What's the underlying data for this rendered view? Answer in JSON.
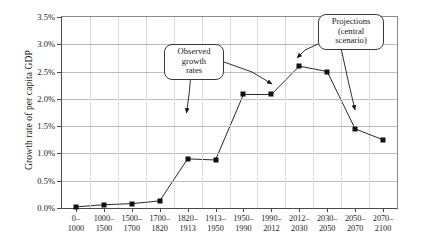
{
  "chart_data": {
    "type": "line",
    "title": "",
    "xlabel": "",
    "ylabel": "Growth rate of per capita GDP",
    "ylim": [
      0.0,
      3.5
    ],
    "ytick_values": [
      0.0,
      0.5,
      1.0,
      1.5,
      2.0,
      2.5,
      3.0,
      3.5
    ],
    "ytick_labels": [
      "0.0%",
      "0.5%",
      "1.0%",
      "1.5%",
      "2.0%",
      "2.5%",
      "3.0%",
      "3.5%"
    ],
    "grid": {
      "horizontal": true,
      "vertical": true,
      "vertical_style": "dotted"
    },
    "legend": null,
    "categories": [
      "0-1000",
      "1000-1500",
      "1500-1700",
      "1700-1820",
      "1820-1913",
      "1913-1950",
      "1950-1990",
      "1990-2012",
      "2012-2030",
      "2030-2050",
      "2050-2070",
      "2070-2100"
    ],
    "tick_labels": [
      {
        "top": "0–",
        "bottom": "1000"
      },
      {
        "top": "1000–",
        "bottom": "1500"
      },
      {
        "top": "1500–",
        "bottom": "1700"
      },
      {
        "top": "1700–",
        "bottom": "1820"
      },
      {
        "top": "1820–",
        "bottom": "1913"
      },
      {
        "top": "1913–",
        "bottom": "1950"
      },
      {
        "top": "1950–",
        "bottom": "1990"
      },
      {
        "top": "1990–",
        "bottom": "2012"
      },
      {
        "top": "2012–",
        "bottom": "2030"
      },
      {
        "top": "2030–",
        "bottom": "2050"
      },
      {
        "top": "2050–",
        "bottom": "2070"
      },
      {
        "top": "2070–",
        "bottom": "2100"
      }
    ],
    "values": [
      0.02,
      0.06,
      0.08,
      0.13,
      0.9,
      0.88,
      2.08,
      2.08,
      2.6,
      2.5,
      1.45,
      1.25
    ],
    "series": [
      {
        "name": "Growth rate of per capita GDP",
        "values": [
          0.02,
          0.06,
          0.08,
          0.13,
          0.9,
          0.88,
          2.08,
          2.08,
          2.6,
          2.5,
          1.45,
          1.25
        ],
        "marker": "filled-square",
        "color": "#111111"
      }
    ],
    "annotations": [
      {
        "id": "observed",
        "lines": [
          "Observed",
          "growth",
          "rates"
        ],
        "points_to": [
          "1820-1913",
          "1950-1990"
        ]
      },
      {
        "id": "projections",
        "lines": [
          "Projections",
          "(central",
          "scenario)"
        ],
        "points_to": [
          "2012-2030",
          "2050-2070"
        ]
      }
    ]
  }
}
